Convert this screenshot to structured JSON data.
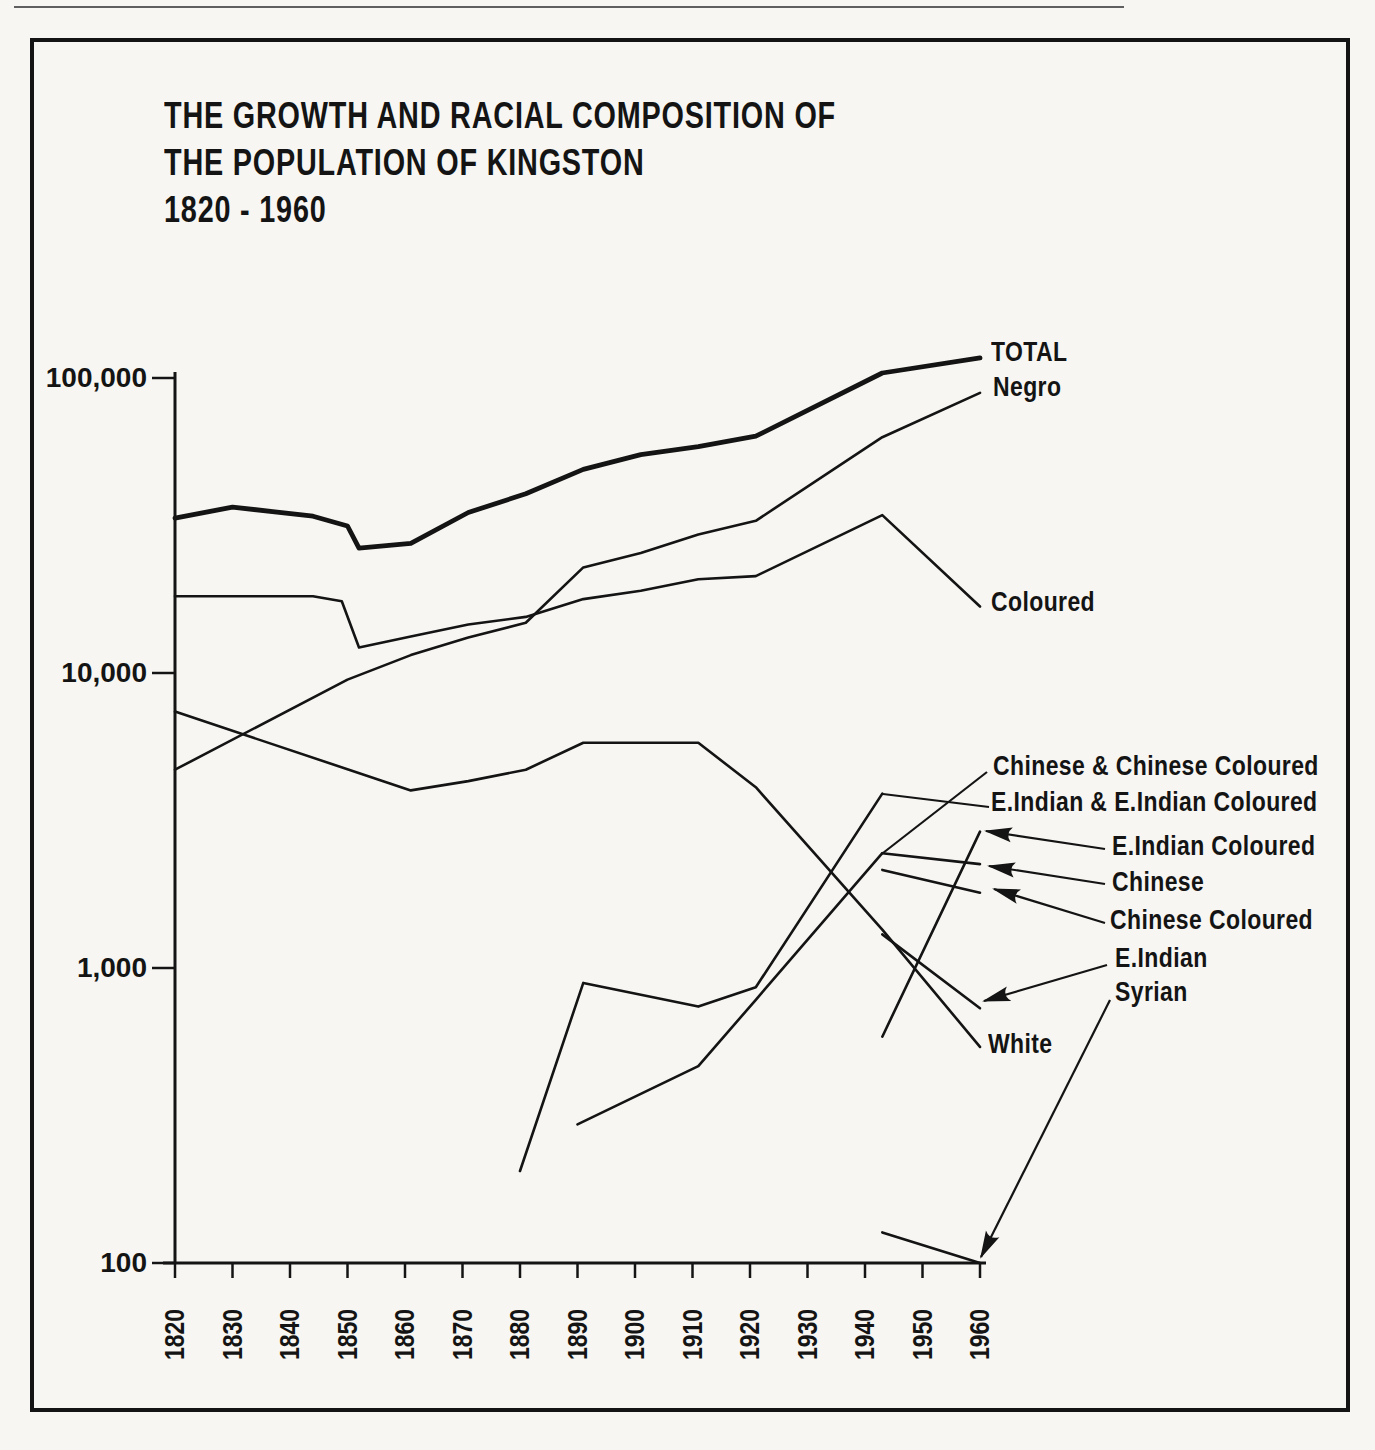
{
  "figure": {
    "title_lines": [
      "THE GROWTH AND RACIAL COMPOSITION OF",
      "THE POPULATION OF KINGSTON",
      "1820 - 1960"
    ]
  },
  "chart_data": {
    "type": "line",
    "xlabel": "",
    "ylabel": "",
    "x_axis": {
      "range": [
        1820,
        1960
      ],
      "ticks": [
        1820,
        1830,
        1840,
        1850,
        1860,
        1870,
        1880,
        1890,
        1900,
        1910,
        1920,
        1930,
        1940,
        1950,
        1960
      ],
      "tick_labels": [
        "1820",
        "1830",
        "1840",
        "1850",
        "1860",
        "1870",
        "1880",
        "1890",
        "1900",
        "1910",
        "1920",
        "1930",
        "1940",
        "1950",
        "1960"
      ]
    },
    "y_axis": {
      "scale": "log",
      "range": [
        100,
        100000
      ],
      "ticks": [
        100,
        1000,
        10000,
        100000
      ],
      "tick_labels": [
        "100",
        "1,000",
        "10,000",
        "100,000"
      ]
    },
    "grid": false,
    "legend_position": "right-of-line-ends",
    "series": [
      {
        "key": "total",
        "label": "TOTAL",
        "thick": true,
        "arrow": false,
        "points": [
          [
            1820,
            33500
          ],
          [
            1830,
            36500
          ],
          [
            1844,
            34000
          ],
          [
            1850,
            31500
          ],
          [
            1852,
            26500
          ],
          [
            1861,
            27500
          ],
          [
            1871,
            35000
          ],
          [
            1881,
            40500
          ],
          [
            1891,
            49000
          ],
          [
            1901,
            55000
          ],
          [
            1911,
            58500
          ],
          [
            1921,
            63500
          ],
          [
            1943,
            104000
          ],
          [
            1960,
            117000
          ]
        ]
      },
      {
        "key": "negro",
        "label": "Negro",
        "thick": false,
        "arrow": false,
        "points": [
          [
            1820,
            4700
          ],
          [
            1850,
            9500
          ],
          [
            1861,
            11500
          ],
          [
            1871,
            13200
          ],
          [
            1881,
            14800
          ],
          [
            1891,
            22800
          ],
          [
            1901,
            25500
          ],
          [
            1911,
            29500
          ],
          [
            1921,
            32800
          ],
          [
            1943,
            63000
          ],
          [
            1960,
            89000
          ]
        ]
      },
      {
        "key": "coloured",
        "label": "Coloured",
        "thick": false,
        "arrow": false,
        "points": [
          [
            1820,
            18200
          ],
          [
            1844,
            18200
          ],
          [
            1849,
            17500
          ],
          [
            1852,
            12200
          ],
          [
            1861,
            13300
          ],
          [
            1871,
            14600
          ],
          [
            1881,
            15500
          ],
          [
            1891,
            17800
          ],
          [
            1901,
            19000
          ],
          [
            1911,
            20800
          ],
          [
            1921,
            21300
          ],
          [
            1943,
            34300
          ],
          [
            1960,
            16800
          ]
        ]
      },
      {
        "key": "white",
        "label": "White",
        "thick": false,
        "arrow": false,
        "points": [
          [
            1820,
            7400
          ],
          [
            1861,
            4000
          ],
          [
            1871,
            4300
          ],
          [
            1881,
            4700
          ],
          [
            1891,
            5800
          ],
          [
            1911,
            5800
          ],
          [
            1921,
            4100
          ],
          [
            1943,
            1350
          ],
          [
            1960,
            540
          ]
        ]
      },
      {
        "key": "eind_comb",
        "label": "E.Indian & E.Indian Coloured",
        "thick": false,
        "arrow": false,
        "points": [
          [
            1880,
            205
          ],
          [
            1891,
            890
          ],
          [
            1911,
            740
          ],
          [
            1921,
            860
          ],
          [
            1943,
            3900
          ]
        ]
      },
      {
        "key": "chin_comb",
        "label": "Chinese & Chinese Coloured",
        "thick": false,
        "arrow": false,
        "points": [
          [
            1890,
            295
          ],
          [
            1911,
            465
          ],
          [
            1921,
            780
          ],
          [
            1943,
            2450
          ]
        ]
      },
      {
        "key": "eind_col",
        "label": "E.Indian Coloured",
        "thick": false,
        "arrow": true,
        "points": [
          [
            1943,
            585
          ],
          [
            1960,
            2900
          ]
        ]
      },
      {
        "key": "chinese",
        "label": "Chinese",
        "thick": false,
        "arrow": true,
        "points": [
          [
            1943,
            2450
          ],
          [
            1960,
            2250
          ]
        ]
      },
      {
        "key": "chin_col",
        "label": "Chinese Coloured",
        "thick": false,
        "arrow": true,
        "points": [
          [
            1943,
            2150
          ],
          [
            1960,
            1800
          ]
        ]
      },
      {
        "key": "eind",
        "label": "E.Indian",
        "thick": false,
        "arrow": true,
        "points": [
          [
            1943,
            1300
          ],
          [
            1960,
            730
          ]
        ]
      },
      {
        "key": "syrian",
        "label": "Syrian",
        "thick": false,
        "arrow": true,
        "points": [
          [
            1943,
            127
          ],
          [
            1960,
            100
          ]
        ]
      }
    ]
  }
}
